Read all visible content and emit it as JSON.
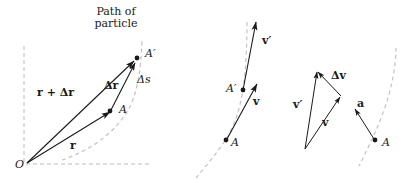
{
  "figure": {
    "title_caption": "Path of particle",
    "background_color": "#ffffff",
    "stroke_color": "#1a1a1a",
    "dash_color": "#b0b0b0",
    "width": 415,
    "height": 183
  },
  "panel_left": {
    "name": "position-vector-panel",
    "path_label_line1": "Path of",
    "path_label_line2": "particle",
    "origin_label": "O",
    "point_a_label": "A",
    "point_a_prime_label": "A′",
    "vector_r_label": "r",
    "vector_r_plus_dr_label": "r + Δr",
    "vector_dr_label": "Δr",
    "arc_length_label": "Δs"
  },
  "panel_middle": {
    "name": "velocity-vectors-panel",
    "point_a_label": "A",
    "point_a_prime_label": "A′",
    "vector_v_label": "v",
    "vector_v_prime_label": "v′"
  },
  "panel_right": {
    "name": "velocity-difference-panel",
    "vector_v_label": "v",
    "vector_v_prime_label": "v′",
    "vector_dv_label": "Δv",
    "vector_a_label": "a",
    "point_a_label": "A"
  }
}
